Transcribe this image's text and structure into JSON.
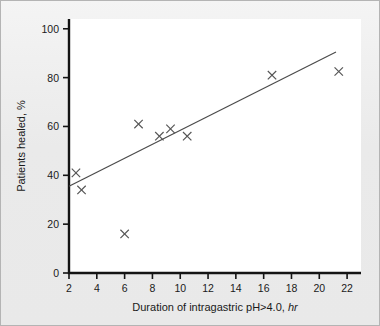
{
  "figure": {
    "background_color": "#ececec",
    "border_color": "#b4b4b4",
    "plot_background": "#ffffff"
  },
  "chart_data": {
    "type": "scatter",
    "title": "",
    "xlabel": "Duration of intragastric pH>4.0, hr",
    "xlabel_main": "Duration of intragastric pH>4.0,",
    "xlabel_italic": "hr",
    "ylabel": "Patients healed, %",
    "xlim": [
      2,
      23
    ],
    "ylim": [
      0,
      104
    ],
    "xticks": [
      2,
      4,
      6,
      8,
      10,
      12,
      14,
      16,
      18,
      20,
      22
    ],
    "xtick_labels": [
      "2",
      "4",
      "6",
      "8",
      "10",
      "12",
      "14",
      "16",
      "18",
      "20",
      "22"
    ],
    "yticks": [
      0,
      20,
      40,
      60,
      80,
      100
    ],
    "ytick_labels": [
      "0",
      "20",
      "40",
      "60",
      "80",
      "100"
    ],
    "grid": false,
    "legend": "none",
    "marker_style": "x",
    "marker_color": "#545454",
    "line_color": "#4a4a4a",
    "points": [
      {
        "x": 2.5,
        "y": 41.0
      },
      {
        "x": 2.9,
        "y": 34.0
      },
      {
        "x": 6.0,
        "y": 16.0
      },
      {
        "x": 7.0,
        "y": 61.0
      },
      {
        "x": 8.5,
        "y": 56.0
      },
      {
        "x": 9.3,
        "y": 59.0
      },
      {
        "x": 10.5,
        "y": 56.0
      },
      {
        "x": 16.6,
        "y": 81.0
      },
      {
        "x": 21.4,
        "y": 82.5
      }
    ],
    "trendline": {
      "x_start": 2.0,
      "y_start": 35.5,
      "x_end": 21.2,
      "y_end": 90.5
    }
  }
}
